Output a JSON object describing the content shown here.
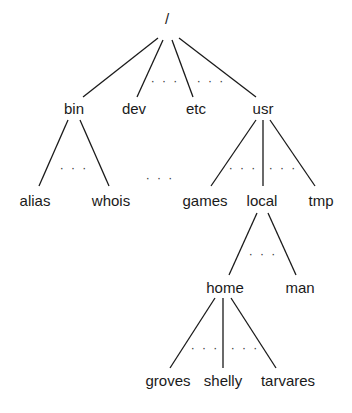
{
  "diagram": {
    "type": "directory-tree",
    "line_color": "#1a1a1a",
    "nodes": [
      {
        "id": "root",
        "label": "/",
        "x": 167,
        "y": 18
      },
      {
        "id": "bin",
        "label": "bin",
        "x": 74,
        "y": 108
      },
      {
        "id": "dev",
        "label": "dev",
        "x": 134,
        "y": 108
      },
      {
        "id": "etc",
        "label": "etc",
        "x": 196,
        "y": 108
      },
      {
        "id": "usr",
        "label": "usr",
        "x": 263,
        "y": 108
      },
      {
        "id": "alias",
        "label": "alias",
        "x": 35,
        "y": 200
      },
      {
        "id": "whois",
        "label": "whois",
        "x": 111,
        "y": 200
      },
      {
        "id": "games",
        "label": "games",
        "x": 205,
        "y": 200
      },
      {
        "id": "local",
        "label": "local",
        "x": 262,
        "y": 200
      },
      {
        "id": "tmp",
        "label": "tmp",
        "x": 321,
        "y": 200
      },
      {
        "id": "home",
        "label": "home",
        "x": 225,
        "y": 287
      },
      {
        "id": "man",
        "label": "man",
        "x": 300,
        "y": 287
      },
      {
        "id": "groves",
        "label": "groves",
        "x": 168,
        "y": 380
      },
      {
        "id": "shelly",
        "label": "shelly",
        "x": 223,
        "y": 380
      },
      {
        "id": "tarvares",
        "label": "tarvares",
        "x": 288,
        "y": 380
      }
    ],
    "edges": [
      {
        "from": "root",
        "to": "bin",
        "x1": 158,
        "y1": 38,
        "x2": 83,
        "y2": 97
      },
      {
        "from": "root",
        "to": "dev",
        "x1": 163,
        "y1": 40,
        "x2": 137,
        "y2": 97
      },
      {
        "from": "root",
        "to": "etc",
        "x1": 172,
        "y1": 40,
        "x2": 193,
        "y2": 97
      },
      {
        "from": "root",
        "to": "usr",
        "x1": 179,
        "y1": 38,
        "x2": 256,
        "y2": 97
      },
      {
        "from": "bin",
        "to": "alias",
        "x1": 68,
        "y1": 120,
        "x2": 39,
        "y2": 186
      },
      {
        "from": "bin",
        "to": "whois",
        "x1": 80,
        "y1": 120,
        "x2": 109,
        "y2": 186
      },
      {
        "from": "usr",
        "to": "games",
        "x1": 256,
        "y1": 120,
        "x2": 211,
        "y2": 186
      },
      {
        "from": "usr",
        "to": "local",
        "x1": 263,
        "y1": 120,
        "x2": 263,
        "y2": 186
      },
      {
        "from": "usr",
        "to": "tmp",
        "x1": 270,
        "y1": 120,
        "x2": 315,
        "y2": 186
      },
      {
        "from": "local",
        "to": "home",
        "x1": 257,
        "y1": 213,
        "x2": 229,
        "y2": 275
      },
      {
        "from": "local",
        "to": "man",
        "x1": 268,
        "y1": 213,
        "x2": 296,
        "y2": 275
      },
      {
        "from": "home",
        "to": "groves",
        "x1": 215,
        "y1": 298,
        "x2": 170,
        "y2": 368
      },
      {
        "from": "home",
        "to": "shelly",
        "x1": 223,
        "y1": 298,
        "x2": 223,
        "y2": 368
      },
      {
        "from": "home",
        "to": "tarvares",
        "x1": 231,
        "y1": 298,
        "x2": 276,
        "y2": 368
      }
    ],
    "ellipses": [
      {
        "label": "...",
        "x": 165,
        "y": 81
      },
      {
        "label": "...",
        "x": 211,
        "y": 81
      },
      {
        "label": "...",
        "x": 74,
        "y": 168
      },
      {
        "label": "...",
        "x": 160,
        "y": 178
      },
      {
        "label": "...",
        "x": 243,
        "y": 168
      },
      {
        "label": "...",
        "x": 283,
        "y": 168
      },
      {
        "label": "...",
        "x": 263,
        "y": 254
      },
      {
        "label": "...",
        "x": 205,
        "y": 348
      },
      {
        "label": "...",
        "x": 245,
        "y": 348
      }
    ]
  }
}
